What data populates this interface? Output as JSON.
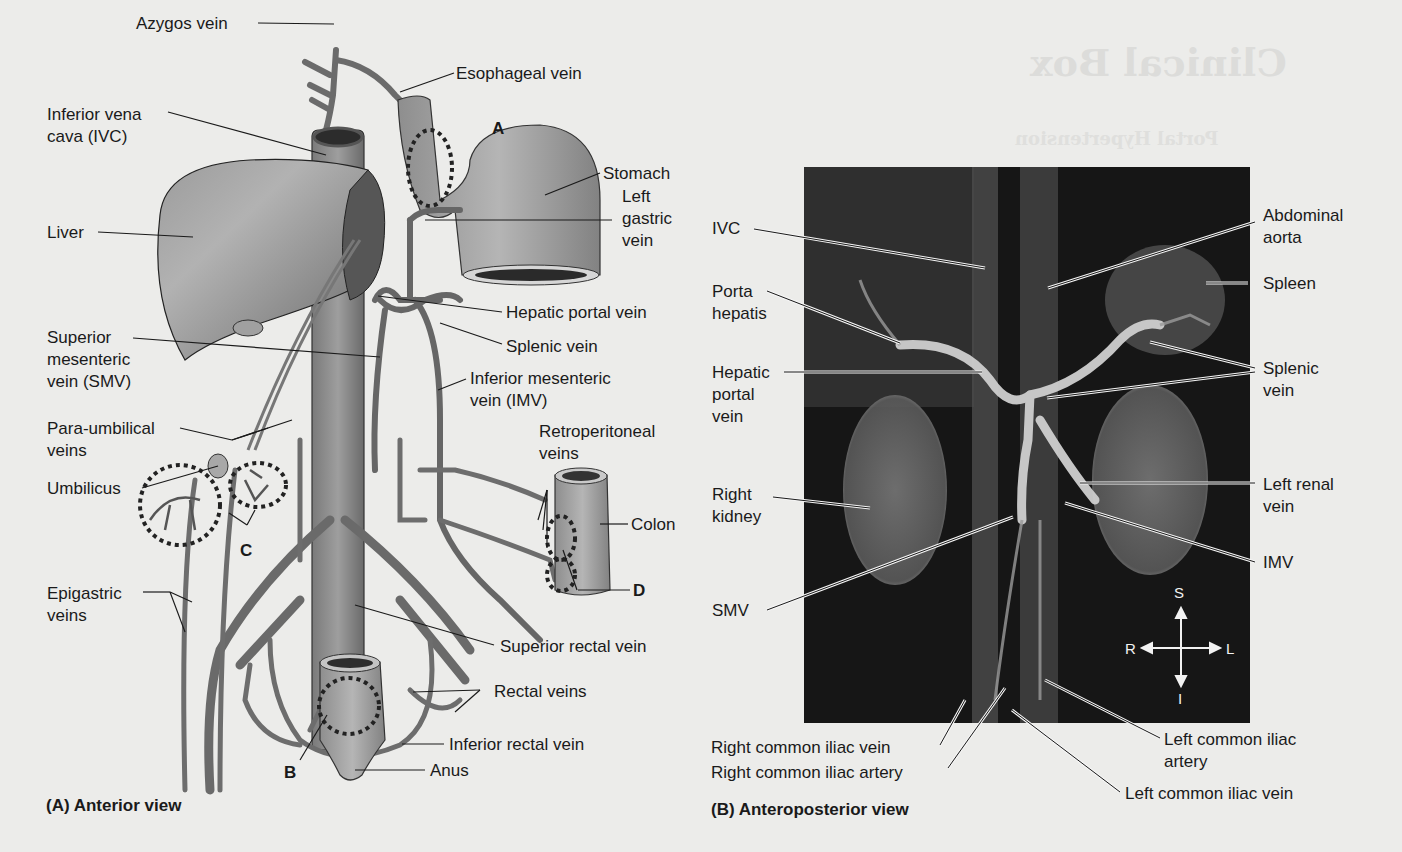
{
  "background_bleed": {
    "title": "Clinical Box",
    "subtitle": "Portal Hypertension"
  },
  "panel_a": {
    "caption": "(A) Anterior view",
    "labels": {
      "azygos": "Azygos vein",
      "esophageal": "Esophageal vein",
      "ivc_line1": "Inferior vena",
      "ivc_line2": "cava (IVC)",
      "liver": "Liver",
      "stomach": "Stomach",
      "left_gastric_1": "Left",
      "left_gastric_2": "gastric",
      "left_gastric_3": "vein",
      "hepatic_portal": "Hepatic portal vein",
      "splenic": "Splenic vein",
      "smv_1": "Superior",
      "smv_2": "mesenteric",
      "smv_3": "vein (SMV)",
      "imv_1": "Inferior mesenteric",
      "imv_2": "vein (IMV)",
      "para_1": "Para-umbilical",
      "para_2": "veins",
      "retro_1": "Retroperitoneal",
      "retro_2": "veins",
      "umbilicus": "Umbilicus",
      "colon": "Colon",
      "epigastric_1": "Epigastric",
      "epigastric_2": "veins",
      "superior_rectal": "Superior rectal vein",
      "rectal": "Rectal veins",
      "inferior_rectal": "Inferior rectal vein",
      "anus": "Anus"
    },
    "markers": {
      "a": "A",
      "b": "B",
      "c": "C",
      "d": "D"
    }
  },
  "panel_b": {
    "caption": "(B) Anteroposterior view",
    "labels": {
      "ivc": "IVC",
      "abdominal_aorta_1": "Abdominal",
      "abdominal_aorta_2": "aorta",
      "spleen": "Spleen",
      "porta_1": "Porta",
      "porta_2": "hepatis",
      "hpv_1": "Hepatic",
      "hpv_2": "portal",
      "hpv_3": "vein",
      "splenic_1": "Splenic",
      "splenic_2": "vein",
      "right_kidney_1": "Right",
      "right_kidney_2": "kidney",
      "left_renal_1": "Left renal",
      "left_renal_2": "vein",
      "imv": "IMV",
      "smv": "SMV",
      "r_cil_vein": "Right common iliac vein",
      "r_cil_artery": "Right common iliac artery",
      "l_cil_artery_1": "Left common iliac",
      "l_cil_artery_2": "artery",
      "l_cil_vein": "Left common iliac vein"
    },
    "compass": {
      "s": "S",
      "i": "I",
      "r": "R",
      "l": "L"
    }
  },
  "colors": {
    "paper": "#ececea",
    "vessel": "#6f6f6f",
    "vessel_dark": "#3e3e3e",
    "organ": "#8a8a8a",
    "mri_bg": "#161616",
    "text": "#1a1a1a"
  }
}
